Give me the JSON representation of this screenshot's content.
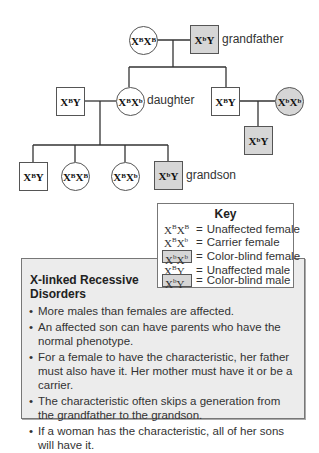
{
  "pedigree": {
    "gen1": {
      "grandmother": {
        "genotype_base": "X",
        "sup1": "B",
        "base2": "X",
        "sup2": "B",
        "sex": "female",
        "affected": false
      },
      "grandfather": {
        "genotype_base": "X",
        "sup1": "b",
        "base2": "Y",
        "sex": "male",
        "affected": true,
        "label": "grandfather"
      }
    },
    "gen2": {
      "daughter_husband": {
        "genotype_base": "X",
        "sup1": "B",
        "base2": "Y",
        "sex": "male",
        "affected": false
      },
      "daughter": {
        "genotype_base": "X",
        "sup1": "B",
        "base2": "X",
        "sup2": "b",
        "sex": "female",
        "affected": false,
        "label": "daughter"
      },
      "son": {
        "genotype_base": "X",
        "sup1": "B",
        "base2": "Y",
        "sex": "male",
        "affected": false
      },
      "son_wife": {
        "genotype_base": "X",
        "sup1": "b",
        "base2": "X",
        "sup2": "b",
        "sex": "female",
        "affected": true
      }
    },
    "gen3": {
      "child1": {
        "genotype_base": "X",
        "sup1": "B",
        "base2": "Y",
        "sex": "male",
        "affected": false
      },
      "child2": {
        "genotype_base": "X",
        "sup1": "B",
        "base2": "X",
        "sup2": "B",
        "sex": "female",
        "affected": false
      },
      "child3": {
        "genotype_base": "X",
        "sup1": "B",
        "base2": "X",
        "sup2": "b",
        "sex": "female",
        "affected": false
      },
      "grandson": {
        "genotype_base": "X",
        "sup1": "b",
        "base2": "Y",
        "sex": "male",
        "affected": true,
        "label": "grandson"
      },
      "son_child": {
        "genotype_base": "X",
        "sup1": "b",
        "base2": "Y",
        "sex": "male",
        "affected": true
      }
    }
  },
  "key": {
    "title": "Key",
    "rows": [
      {
        "b1": "X",
        "s1": "B",
        "b2": "X",
        "s2": "B",
        "eq": "=",
        "desc": "Unaffected female",
        "boxed": false
      },
      {
        "b1": "X",
        "s1": "B",
        "b2": "X",
        "s2": "b",
        "eq": "=",
        "desc": "Carrier female",
        "boxed": false
      },
      {
        "b1": "X",
        "s1": "b",
        "b2": "X",
        "s2": "b",
        "eq": "=",
        "desc": "Color-blind female",
        "boxed": true
      },
      {
        "b1": "X",
        "s1": "B",
        "b2": "Y",
        "s2": "",
        "eq": "=",
        "desc": "Unaffected male",
        "boxed": false
      },
      {
        "b1": "X",
        "s1": "b",
        "b2": "Y",
        "s2": "",
        "eq": "=",
        "desc": "Color-blind male",
        "boxed": true
      }
    ]
  },
  "info": {
    "title": "X-linked Recessive Disorders",
    "bullet": "•",
    "items": [
      "More males than females are affected.",
      "An affected son can have parents who have the normal phenotype.",
      "For a female to have the characteristic, her father must also have it. Her mother must have it or be a carrier.",
      "The characteristic often skips a generation from the grandfather to the grandson.",
      "If a woman has the characteristic, all of her sons will have it."
    ]
  },
  "colors": {
    "affected_fill": "#d6d6d6",
    "info_box_bg": "#ececec",
    "line": "#333333"
  }
}
